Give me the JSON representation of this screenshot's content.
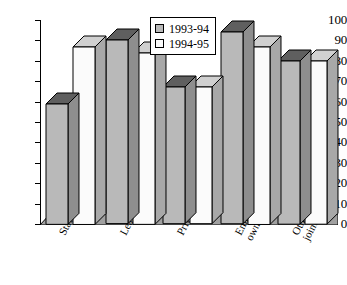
{
  "chart_data": {
    "type": "bar",
    "title": "",
    "subtitle": "",
    "xlabel": "",
    "ylabel": "",
    "ylim": [
      0,
      100
    ],
    "ytick_step": 10,
    "yticks": [
      "100",
      "90",
      "80",
      "70",
      "60",
      "50",
      "40",
      "30",
      "20",
      "10",
      "0"
    ],
    "grid": false,
    "legend_position": "top-center",
    "style": "3d-column",
    "categories": [
      "State",
      "Leasehold",
      "Private",
      "Employee-owned",
      "Other joint-stock"
    ],
    "category_lines": [
      [
        "State"
      ],
      [
        "Leasehold"
      ],
      [
        "Private"
      ],
      [
        "Employee-",
        "owned"
      ],
      [
        "Other",
        "joint-stock"
      ]
    ],
    "series": [
      {
        "name": "1993-94",
        "color": "#b9b9b9",
        "values": [
          59,
          90,
          67,
          94,
          80
        ]
      },
      {
        "name": "1994-95",
        "color": "#fbfbfb",
        "values": [
          87,
          84,
          67,
          87,
          80
        ]
      }
    ]
  },
  "legend": {
    "entries": [
      {
        "label": "1993-94",
        "swatch": "#b9b9b9"
      },
      {
        "label": "1994-95",
        "swatch": "#fbfbfb"
      }
    ]
  },
  "colors": {
    "series_1993_94_front": "#b9b9b9",
    "series_1993_94_side": "#8e8e8e",
    "series_1993_94_top": "#5f5f5f",
    "series_1994_95_front": "#fbfbfb",
    "series_1994_95_side": "#a8a8a8",
    "series_1994_95_top": "#d0d0d0",
    "floor": "#a0a0a0",
    "axis": "#000000",
    "background": "#ffffff"
  }
}
